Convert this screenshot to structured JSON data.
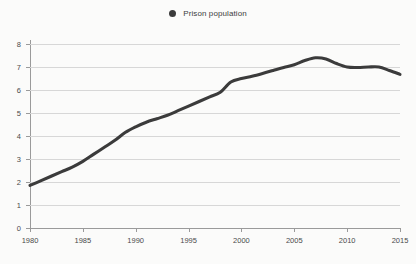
{
  "legend": {
    "position": "top-center",
    "entries": [
      {
        "label": "Prison population",
        "marker": "circle-marker-icon",
        "color": "#3b3b3b"
      }
    ]
  },
  "chart_data": {
    "type": "line",
    "title": "",
    "subtitle": "",
    "xlabel": "",
    "ylabel": "",
    "xlim": [
      1980,
      2015
    ],
    "ylim": [
      0,
      8
    ],
    "grid": true,
    "legend_position": "top-center",
    "x_ticks": [
      1980,
      1985,
      1990,
      1995,
      2000,
      2005,
      2010,
      2015
    ],
    "y_ticks": [
      0,
      1,
      2,
      3,
      4,
      5,
      6,
      7,
      8
    ],
    "series": [
      {
        "name": "Prison population",
        "color": "#3b3b3b",
        "x": [
          1980,
          1981,
          1982,
          1983,
          1984,
          1985,
          1986,
          1987,
          1988,
          1989,
          1990,
          1991,
          1992,
          1993,
          1994,
          1995,
          1996,
          1997,
          1998,
          1999,
          2000,
          2001,
          2002,
          2003,
          2004,
          2005,
          2006,
          2007,
          2008,
          2009,
          2010,
          2011,
          2012,
          2013,
          2014,
          2015
        ],
        "values": [
          1.85,
          2.05,
          2.25,
          2.45,
          2.65,
          2.9,
          3.2,
          3.5,
          3.8,
          4.15,
          4.4,
          4.6,
          4.75,
          4.9,
          5.1,
          5.3,
          5.5,
          5.7,
          5.9,
          6.35,
          6.5,
          6.6,
          6.72,
          6.85,
          6.98,
          7.1,
          7.28,
          7.4,
          7.35,
          7.15,
          7.0,
          6.98,
          7.0,
          7.0,
          6.85,
          6.68
        ]
      }
    ]
  },
  "axes": {
    "y_tick_labels": [
      "0",
      "1",
      "2",
      "3",
      "4",
      "5",
      "6",
      "7",
      "8"
    ],
    "x_tick_labels": [
      "1980",
      "1985",
      "1990",
      "1995",
      "2000",
      "2005",
      "2010",
      "2015"
    ]
  },
  "colors": {
    "series": "#3b3b3b",
    "gridline": "#d7d7d7",
    "axis": "#9a9a9a",
    "background": "#fbfbfa",
    "text": "#4a4a4a"
  }
}
